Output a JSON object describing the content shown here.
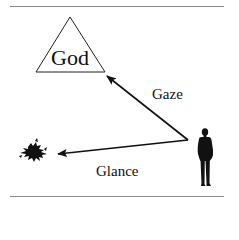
{
  "diagram": {
    "nodes": {
      "god": {
        "label": "God",
        "shape": "triangle"
      },
      "viewer": {
        "label": "",
        "shape": "person-silhouette"
      },
      "object": {
        "label": "",
        "shape": "splat-blob"
      }
    },
    "edges": [
      {
        "from": "viewer",
        "to": "god",
        "label": "Gaze"
      },
      {
        "from": "viewer",
        "to": "object",
        "label": "Glance"
      }
    ],
    "colors": {
      "line": "#111111",
      "rule": "#888888",
      "background": "#ffffff"
    }
  }
}
